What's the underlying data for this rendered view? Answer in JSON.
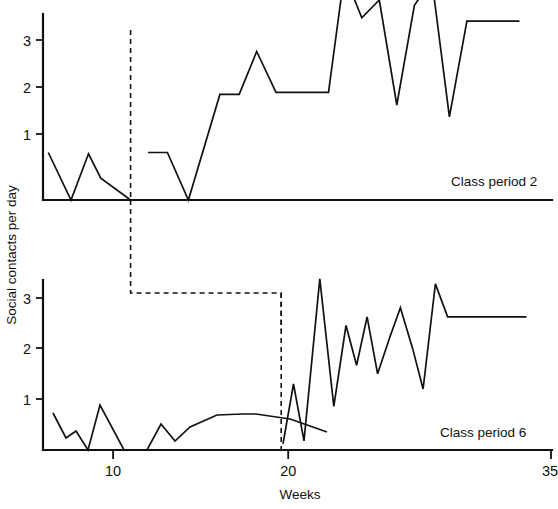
{
  "figure": {
    "ylabel": "Social contacts per day",
    "xlabel": "Weeks"
  },
  "panels": {
    "top": {
      "label": "Class period 2"
    },
    "bottom": {
      "label": "Class period 6"
    }
  },
  "axes": {
    "x_ticks": [
      {
        "value": 10,
        "label": "10"
      },
      {
        "value": 20,
        "label": "20"
      },
      {
        "value": 35,
        "label": "35"
      }
    ],
    "y_ticks": [
      {
        "value": 1,
        "label": "1"
      },
      {
        "value": 2,
        "label": "2"
      },
      {
        "value": 3,
        "label": "3"
      }
    ]
  },
  "chart_data": {
    "type": "line",
    "title": "",
    "xlabel": "Weeks",
    "ylabel": "Social contacts per day",
    "xlim": [
      6,
      35
    ],
    "ylim": [
      0,
      3.6
    ],
    "xticks": [
      10,
      20,
      35
    ],
    "yticks": [
      1,
      2,
      3
    ],
    "grid": false,
    "legend": "none",
    "panels": [
      {
        "name": "Class period 2",
        "annotation": "Class period 2",
        "phase_change_week": 11.0,
        "series": [
          {
            "name": "baseline",
            "phase": "baseline",
            "x": [
              6.3,
              7.6,
              8.6,
              9.3,
              11.0
            ],
            "y": [
              0.72,
              0.0,
              0.7,
              0.33,
              0.0
            ]
          },
          {
            "name": "intervention",
            "phase": "intervention",
            "x": [
              12.0,
              13.1,
              14.3,
              16.1,
              17.2,
              18.2,
              19.3,
              20.3,
              21.3,
              22.3,
              23.2,
              24.2,
              25.2,
              26.2,
              27.2,
              28.2,
              29.2,
              30.2,
              31.2,
              32.2,
              33.2
            ],
            "y": [
              0.72,
              0.72,
              0.0,
              1.6,
              1.6,
              2.25,
              1.63,
              1.63,
              1.63,
              1.63,
              3.42,
              2.76,
              3.03,
              1.44,
              2.95,
              3.33,
              1.26,
              2.71,
              2.71,
              2.71,
              2.71
            ]
          }
        ]
      },
      {
        "name": "Class period 6",
        "annotation": "Class period 6",
        "phase_change_week": 19.6,
        "series": [
          {
            "name": "baseline",
            "phase": "baseline",
            "x": [
              6.3,
              7.2,
              7.9,
              8.8,
              9.6,
              11.0,
              12.0,
              13.0,
              14.0,
              16.0,
              17.5,
              19.5
            ],
            "y": [
              0.73,
              0.24,
              0.37,
              0.0,
              0.88,
              0.0,
              0.52,
              0.17,
              0.45,
              0.7,
              0.52,
              0.36
            ]
          },
          {
            "name": "intervention",
            "phase": "intervention",
            "x": [
              19.7,
              20.3,
              20.9,
              21.8,
              22.6,
              23.3,
              23.9,
              24.5,
              25.1,
              25.8,
              26.4,
              27.1,
              27.7,
              28.4,
              29.1,
              29.8,
              30.5,
              31.2,
              32.0,
              32.8,
              33.6
            ],
            "y": [
              0.12,
              1.3,
              0.18,
              3.37,
              0.86,
              2.45,
              1.67,
              2.62,
              1.5,
              2.22,
              2.8,
              2.0,
              1.2,
              3.27,
              2.62,
              2.62,
              2.62,
              2.62,
              2.62,
              2.62,
              2.62
            ]
          }
        ]
      }
    ]
  }
}
